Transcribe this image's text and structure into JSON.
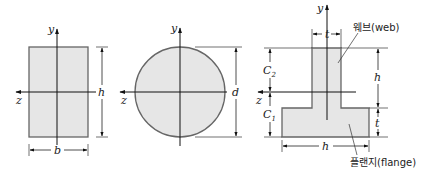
{
  "figure": {
    "sections": [
      {
        "id": "rectangle",
        "shape": "rectangle",
        "axes": {
          "vertical": "y",
          "horizontal": "z"
        },
        "dimensions": {
          "width": "b",
          "height": "h"
        }
      },
      {
        "id": "circle",
        "shape": "circle",
        "axes": {
          "vertical": "y",
          "horizontal": "z"
        },
        "dimensions": {
          "diameter": "d"
        }
      },
      {
        "id": "t-section",
        "shape": "T",
        "axes": {
          "vertical": "y",
          "horizontal": "z"
        },
        "dimensions": {
          "web_thickness": "t",
          "web_height": "h",
          "flange_thickness": "t",
          "flange_width": "h",
          "upper_distance": "C",
          "upper_distance_sub": "2",
          "lower_distance": "C",
          "lower_distance_sub": "1"
        },
        "callouts": {
          "web": "웨브(web)",
          "flange": "플랜지(flange)"
        }
      }
    ]
  },
  "labels": {
    "rect_y": "y",
    "rect_z": "z",
    "rect_h": "h",
    "rect_b": "b",
    "circ_y": "y",
    "circ_z": "z",
    "circ_d": "d",
    "t_y": "y",
    "t_z": "z",
    "t_top_t": "t",
    "t_right_h": "h",
    "t_right_t": "t",
    "t_bottom_h": "h",
    "t_c2": "C",
    "t_c2_sub": "2",
    "t_c1": "C",
    "t_c1_sub": "1",
    "web_callout": "웨브(web)",
    "flange_callout": "플랜지(flange)"
  },
  "colors": {
    "fill": "#e6e6e6",
    "outline": "#666666",
    "ink": "#222222"
  }
}
